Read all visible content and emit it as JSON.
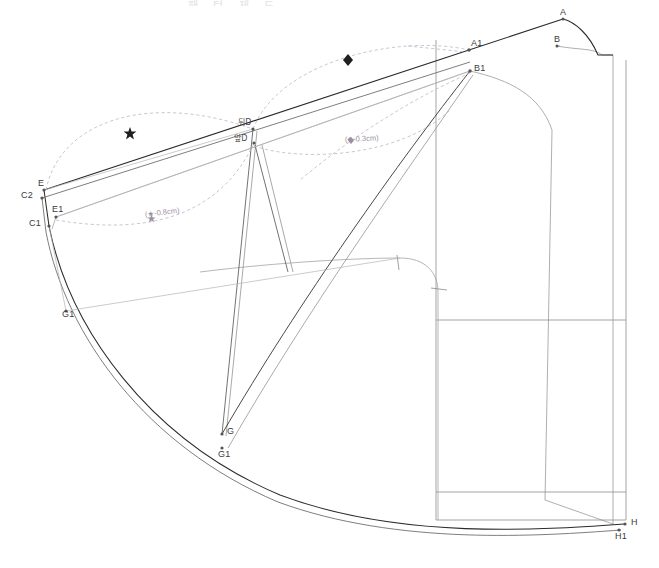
{
  "document": {
    "title_partial": "패 턴 제 도",
    "kind": "sewing-pattern-draft"
  },
  "colors": {
    "outline_dark": "#2b2b2b",
    "outline_mid": "#6d6d6d",
    "outline_light": "#9a9a9a",
    "construction": "#b0b0b0",
    "guide_violet": "#b0a3b8",
    "label_text": "#3a3a3a",
    "annotation_text": "#9b8fa0",
    "background": "#ffffff"
  },
  "points": [
    {
      "id": "A",
      "label": "A",
      "x": 563,
      "y": 19,
      "lx": 560,
      "ly": 11
    },
    {
      "id": "B",
      "label": "B",
      "x": 557,
      "y": 46,
      "lx": 554,
      "ly": 38
    },
    {
      "id": "A1",
      "label": "A1",
      "x": 469,
      "y": 50,
      "lx": 470,
      "ly": 42
    },
    {
      "id": "B1",
      "label": "B1",
      "x": 470,
      "y": 71,
      "lx": 473,
      "ly": 67
    },
    {
      "id": "E",
      "label": "E",
      "x": 44,
      "y": 190,
      "lx": 39,
      "ly": 182
    },
    {
      "id": "C2",
      "label": "C2",
      "x": 42,
      "y": 198,
      "lx": 23,
      "ly": 194
    },
    {
      "id": "E1",
      "label": "E1",
      "x": 56,
      "y": 217,
      "lx": 53,
      "ly": 208
    },
    {
      "id": "C1",
      "label": "C1",
      "x": 49,
      "y": 226,
      "lx": 31,
      "ly": 222
    },
    {
      "id": "G1",
      "label": "G1",
      "x": 66,
      "y": 311,
      "lx": 63,
      "ly": 311
    },
    {
      "id": "G",
      "label": "G",
      "x": 222,
      "y": 434,
      "lx": 226,
      "ly": 430
    },
    {
      "id": "G1b",
      "label": "G1",
      "x": 222,
      "y": 448,
      "lx": 219,
      "ly": 452
    },
    {
      "id": "H",
      "label": "H",
      "x": 625,
      "y": 524,
      "lx": 630,
      "ly": 520
    },
    {
      "id": "H1",
      "label": "H1",
      "x": 619,
      "y": 530,
      "lx": 616,
      "ly": 534
    },
    {
      "id": "Dback",
      "label": "뒤D",
      "x": 253,
      "y": 129,
      "lx": 239,
      "ly": 121,
      "kr": true
    },
    {
      "id": "Dfront",
      "label": "앞D",
      "x": 254,
      "y": 143,
      "lx": 235,
      "ly": 137,
      "kr": true
    }
  ],
  "annotations": [
    {
      "id": "ann-star-08",
      "text": "(★-0.8cm)",
      "x": 143,
      "y": 215,
      "rotate": -7
    },
    {
      "id": "ann-diamond-03",
      "text": "(◆-0.3cm)",
      "x": 345,
      "y": 140,
      "rotate": -3
    }
  ],
  "markers": [
    {
      "id": "marker-star",
      "shape": "star",
      "x": 130,
      "y": 133
    },
    {
      "id": "marker-diamond",
      "shape": "diamond",
      "x": 348,
      "y": 60
    }
  ],
  "legend_notes": {
    "star_symbol": "★",
    "diamond_symbol": "◆",
    "unit": "cm"
  }
}
